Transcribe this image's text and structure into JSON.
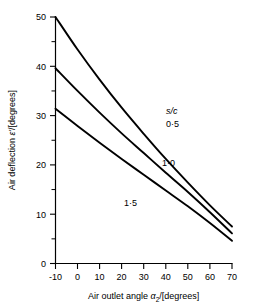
{
  "chart_data": {
    "type": "line",
    "title": "",
    "xlabel": "Air outlet angle α₂/[degrees]",
    "ylabel": "Air deflection ε'/[degrees]",
    "xlim": [
      -10,
      70
    ],
    "ylim": [
      0,
      50
    ],
    "xticks": [
      -10,
      0,
      10,
      20,
      30,
      40,
      50,
      60,
      70
    ],
    "xtick_labels": [
      "-10",
      "0",
      "10",
      "20",
      "30",
      "40",
      "50",
      "60",
      "70"
    ],
    "yticks": [
      0,
      10,
      20,
      30,
      40,
      50
    ],
    "ytick_labels": [
      "0",
      "10",
      "20",
      "30",
      "40",
      "50"
    ],
    "y_minor_ticks": [
      5,
      15,
      25,
      35,
      45
    ],
    "grid": false,
    "legend_position": "inside-right",
    "legend_title": "s/c",
    "series": [
      {
        "name": "0·5",
        "label": "0·5",
        "x": [
          -10,
          0,
          10,
          20,
          30,
          40,
          50,
          60,
          70
        ],
        "values": [
          50.0,
          43.4,
          37.3,
          31.6,
          26.3,
          21.2,
          16.4,
          11.8,
          7.5
        ]
      },
      {
        "name": "1·0",
        "label": "1·0",
        "x": [
          -10,
          0,
          10,
          20,
          30,
          40,
          50,
          60,
          70
        ],
        "values": [
          39.6,
          35.0,
          30.6,
          26.4,
          22.4,
          18.4,
          14.5,
          10.4,
          6.1
        ]
      },
      {
        "name": "1·5",
        "label": "1·5",
        "x": [
          -10,
          0,
          10,
          20,
          30,
          40,
          50,
          60,
          70
        ],
        "values": [
          31.4,
          27.9,
          24.5,
          21.2,
          18.0,
          14.8,
          11.6,
          8.2,
          4.6
        ]
      }
    ]
  },
  "labels": {
    "legend_title": "s/c",
    "series_0": "0·5",
    "series_1": "1·0",
    "series_2": "1·5",
    "y_title_pre": "Air deflection ",
    "y_title_sym": "ε'",
    "y_title_post": "/[degrees]",
    "x_title_pre": "Air outlet angle ",
    "x_title_sym": "α",
    "x_title_sub": "2",
    "x_title_post": "/[degrees]",
    "xt0": "-10",
    "xt1": "0",
    "xt2": "10",
    "xt3": "20",
    "xt4": "30",
    "xt5": "40",
    "xt6": "50",
    "xt7": "60",
    "xt8": "70",
    "yt0": "0",
    "yt1": "10",
    "yt2": "20",
    "yt3": "30",
    "yt4": "40",
    "yt5": "50"
  },
  "colors": {
    "ink": "#000000",
    "background": "#ffffff"
  }
}
